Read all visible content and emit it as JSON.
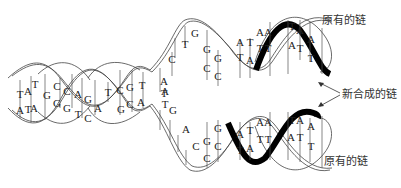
{
  "diagram": {
    "labels": {
      "original_top": "原有的链",
      "new_strand": "新合成的链",
      "original_bottom": "原有的链"
    },
    "parent_duplex": {
      "pairs": [
        {
          "top": "T",
          "bottom": "A"
        },
        {
          "top": "A",
          "bottom": "T"
        },
        {
          "top": "T",
          "bottom": "A"
        },
        {
          "top": "G",
          "bottom": "C"
        },
        {
          "top": "C",
          "bottom": "G"
        },
        {
          "top": "C",
          "bottom": "G"
        },
        {
          "top": "A",
          "bottom": "T"
        },
        {
          "top": "G",
          "bottom": "C"
        },
        {
          "top": "T",
          "bottom": "A"
        },
        {
          "top": "C",
          "bottom": "G"
        },
        {
          "top": "G",
          "bottom": "C"
        },
        {
          "top": "T",
          "bottom": "A"
        }
      ]
    },
    "fork_unpaired": {
      "top_strand": [
        "A",
        "T",
        "C",
        "T",
        "G"
      ],
      "bottom_strand": [
        "T",
        "A",
        "G",
        "A",
        "C"
      ]
    },
    "daughter_top": {
      "pairs": [
        {
          "top": "G",
          "bottom": "C"
        },
        {
          "top": "G",
          "bottom": "C"
        },
        {
          "top": "A",
          "bottom": "T"
        },
        {
          "top": "T",
          "bottom": "A"
        },
        {
          "top": "A",
          "bottom": "T"
        },
        {
          "top": "A",
          "bottom": "T"
        },
        {
          "top": "T",
          "bottom": "A"
        },
        {
          "top": "A",
          "bottom": "T"
        },
        {
          "top": "A",
          "bottom": "T"
        }
      ]
    },
    "daughter_bottom": {
      "pairs": [
        {
          "top": "G",
          "bottom": "C"
        },
        {
          "top": "G",
          "bottom": "C"
        },
        {
          "top": "A",
          "bottom": "T"
        },
        {
          "top": "T",
          "bottom": "A"
        },
        {
          "top": "A",
          "bottom": "T"
        },
        {
          "top": "A",
          "bottom": "T"
        },
        {
          "top": "T",
          "bottom": "A"
        },
        {
          "top": "A",
          "bottom": "T"
        },
        {
          "top": "A",
          "bottom": "T"
        }
      ]
    },
    "colors": {
      "new_strand": "#000000",
      "old_strand": "#444444",
      "background": "#ffffff"
    }
  }
}
